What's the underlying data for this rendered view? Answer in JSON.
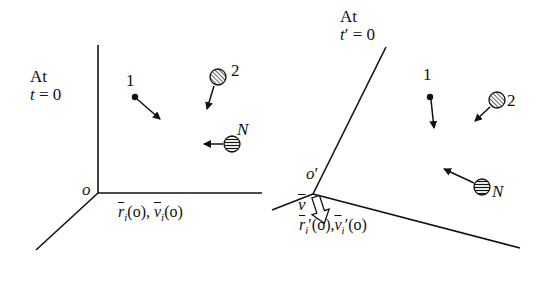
{
  "figure": {
    "left_frame": {
      "title_line1": "At",
      "title_time_var": "t",
      "title_time_eq": " = 0",
      "origin_label": "o",
      "position_label": {
        "r_symbol": "r",
        "r_sub": "i",
        "r_arg": "(o), ",
        "v_symbol": "v",
        "v_sub": "i",
        "v_arg": "(o)"
      },
      "particles": [
        {
          "id": "1",
          "label": "1",
          "style": "solid-dot"
        },
        {
          "id": "2",
          "label": "2",
          "style": "hatched-disk"
        },
        {
          "id": "N",
          "label": "N",
          "style": "hatched-disk"
        }
      ]
    },
    "right_frame": {
      "title_line1": "At",
      "title_time_var": "t",
      "title_time_prime": "′",
      "title_time_eq": " = 0",
      "origin_label": "o",
      "origin_prime": "′",
      "frame_velocity_label": "v",
      "position_label": {
        "r_symbol": "r",
        "r_sub": "i",
        "r_prime": "′",
        "r_arg": "(o),",
        "v_symbol": "v",
        "v_sub": "i",
        "v_prime": "′",
        "v_arg": "(o)"
      },
      "particles": [
        {
          "id": "1",
          "label": "1",
          "style": "solid-dot"
        },
        {
          "id": "2",
          "label": "2",
          "style": "hatched-disk"
        },
        {
          "id": "N",
          "label": "N",
          "style": "hatched-disk"
        }
      ]
    },
    "colors": {
      "ink": "#111111",
      "background": "#ffffff"
    }
  }
}
